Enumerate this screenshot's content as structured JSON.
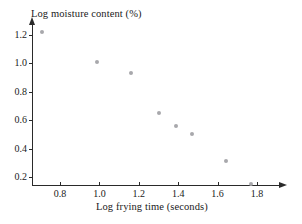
{
  "chart_data": {
    "type": "scatter",
    "title": "",
    "xlabel": "Log frying time (seconds)",
    "ylabel": "Log moisture content (%)",
    "xlim": [
      0.62,
      1.86
    ],
    "ylim": [
      0.08,
      1.28
    ],
    "grid": false,
    "legend": null,
    "xticks": [
      "0.8",
      "1.0",
      "1.2",
      "1.4",
      "1.6",
      "1.8"
    ],
    "xtick_values": [
      0.8,
      1.0,
      1.2,
      1.4,
      1.6,
      1.8
    ],
    "yticks": [
      "0.2",
      "0.4",
      "0.6",
      "0.8",
      "1.0",
      "1.2"
    ],
    "ytick_values": [
      0.2,
      0.4,
      0.6,
      0.8,
      1.0,
      1.2
    ],
    "marker": "circle",
    "marker_color": "#a8a8ac",
    "axis_color": "#2a2a2a",
    "points": [
      {
        "x": 0.71,
        "y": 1.22
      },
      {
        "x": 0.99,
        "y": 1.01
      },
      {
        "x": 1.16,
        "y": 0.93
      },
      {
        "x": 1.3,
        "y": 0.65
      },
      {
        "x": 1.39,
        "y": 0.56
      },
      {
        "x": 1.47,
        "y": 0.5
      },
      {
        "x": 1.64,
        "y": 0.31
      },
      {
        "x": 1.77,
        "y": 0.15
      }
    ]
  }
}
